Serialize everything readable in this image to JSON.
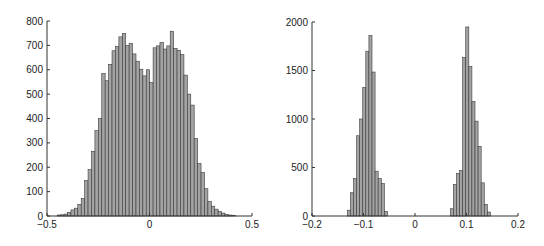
{
  "chart_data": [
    {
      "type": "bar",
      "subtype": "histogram",
      "title": "",
      "xlabel": "",
      "ylabel": "",
      "xlim": [
        -0.5,
        0.5
      ],
      "ylim": [
        0,
        800
      ],
      "grid": false,
      "legend": null,
      "xticks": [
        "-0.5",
        "0",
        "0.5"
      ],
      "xtick_values": [
        -0.5,
        0,
        0.5
      ],
      "yticks": [
        "0",
        "100",
        "200",
        "300",
        "400",
        "500",
        "600",
        "700",
        "800"
      ],
      "ytick_values": [
        0,
        100,
        200,
        300,
        400,
        500,
        600,
        700,
        800
      ],
      "bin_width": 0.0167,
      "bin_start": -0.45,
      "values": [
        4,
        5,
        8,
        15,
        25,
        32,
        48,
        72,
        145,
        190,
        265,
        350,
        400,
        585,
        555,
        622,
        678,
        695,
        735,
        748,
        700,
        708,
        665,
        635,
        602,
        575,
        600,
        548,
        690,
        698,
        712,
        685,
        698,
        758,
        688,
        680,
        662,
        578,
        500,
        455,
        318,
        215,
        178,
        112,
        60,
        40,
        28,
        18,
        12,
        6,
        4,
        2
      ]
    },
    {
      "type": "bar",
      "subtype": "histogram",
      "title": "",
      "xlabel": "",
      "ylabel": "",
      "xlim": [
        -0.2,
        0.2
      ],
      "ylim": [
        0,
        2000
      ],
      "grid": false,
      "legend": null,
      "xticks": [
        "-0.2",
        "-0.1",
        "0",
        "0.1",
        "0.2"
      ],
      "xtick_values": [
        -0.2,
        -0.1,
        0,
        0.1,
        0.2
      ],
      "yticks": [
        "0",
        "500",
        "1000",
        "1500",
        "2000"
      ],
      "ytick_values": [
        0,
        500,
        1000,
        1500,
        2000
      ],
      "bin_width": 0.006,
      "bins": [
        {
          "start": -0.1315,
          "values": [
            60,
            240,
            386,
            827,
            1000,
            1326,
            1699,
            1860,
            1484,
            462,
            386,
            335,
            48
          ]
        },
        {
          "start": 0.0685,
          "values": [
            75,
            325,
            438,
            468,
            1634,
            1949,
            1542,
            1179,
            978,
            718,
            342,
            120,
            41
          ]
        }
      ]
    }
  ]
}
